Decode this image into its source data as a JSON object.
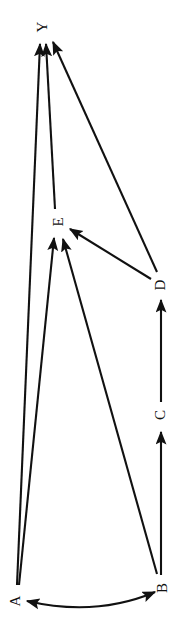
{
  "diagram": {
    "type": "directed-graph",
    "title": "",
    "canvas": {
      "width": 191,
      "height": 641,
      "background": "#ffffff"
    },
    "stroke_color": "#111111",
    "label_rotation_degrees": -90,
    "nodes": [
      {
        "id": "Y",
        "label": "Y",
        "x": 42,
        "y": 27
      },
      {
        "id": "E",
        "label": "E",
        "x": 58,
        "y": 222
      },
      {
        "id": "D",
        "label": "D",
        "x": 160,
        "y": 285
      },
      {
        "id": "C",
        "label": "C",
        "x": 160,
        "y": 415
      },
      {
        "id": "B",
        "label": "B",
        "x": 162,
        "y": 588
      },
      {
        "id": "A",
        "label": "A",
        "x": 15,
        "y": 601
      }
    ],
    "edges": [
      {
        "from": "A",
        "to": "Y",
        "kind": "straight",
        "arrows": "end"
      },
      {
        "from": "A",
        "to": "E",
        "kind": "straight",
        "arrows": "end"
      },
      {
        "from": "E",
        "to": "Y",
        "kind": "straight",
        "arrows": "end"
      },
      {
        "from": "D",
        "to": "Y",
        "kind": "straight",
        "arrows": "end"
      },
      {
        "from": "D",
        "to": "E",
        "kind": "straight",
        "arrows": "end"
      },
      {
        "from": "B",
        "to": "E",
        "kind": "straight",
        "arrows": "end"
      },
      {
        "from": "B",
        "to": "C",
        "kind": "straight",
        "arrows": "end"
      },
      {
        "from": "C",
        "to": "D",
        "kind": "straight",
        "arrows": "end"
      },
      {
        "from": "A",
        "to": "B",
        "kind": "curved",
        "arrows": "both"
      }
    ]
  }
}
